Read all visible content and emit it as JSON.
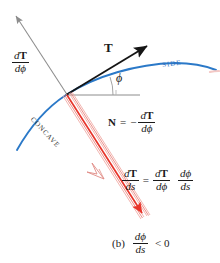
{
  "figure": {
    "caption_prefix": "(b)",
    "caption_relation": "< 0"
  },
  "colors": {
    "curve_blue": "#2b79c8",
    "vector_red": "#e8342a",
    "band_pink": "#f0a6a0",
    "axis_gray": "#8c8c8c",
    "tangent_black": "#151515",
    "text_black": "#1a1a1a"
  },
  "labels": {
    "dT_dphi": {
      "name": "dT/dphi",
      "num_d": "d",
      "num_T": "T",
      "den_d": "d",
      "den_phi": "ϕ"
    },
    "tangent_vector": "T",
    "angle_phi": "ϕ",
    "side": "SIDE",
    "concave": "CONCAVE"
  },
  "normal_equation": {
    "N": "N",
    "equals": "=",
    "minus": "−",
    "num_d": "d",
    "num_T": "T",
    "den_d": "d",
    "den_phi": "ϕ"
  },
  "chain_equation": {
    "lhs": {
      "num_d": "d",
      "num_T": "T",
      "den_d": "d",
      "den_s": "s"
    },
    "equals": "=",
    "rhs1": {
      "num_d": "d",
      "num_T": "T",
      "den_d": "d",
      "den_phi": "ϕ"
    },
    "rhs2": {
      "num_d": "d",
      "num_phi": "ϕ",
      "den_d": "d",
      "den_s": "s"
    }
  },
  "caption_fraction": {
    "num_d": "d",
    "num_phi": "ϕ",
    "den_d": "d",
    "den_s": "s"
  },
  "geometry": {
    "origin": {
      "x": 66,
      "y": 95
    },
    "tangent_tip": {
      "x": 149,
      "y": 45
    },
    "gray_arrow_tip": {
      "x": 14,
      "y": 14
    },
    "horizontal_line_end": {
      "x": 140,
      "y": 95
    },
    "red_solid_tip": {
      "x": 144,
      "y": 216
    },
    "red_hollow_tip": {
      "x": 104,
      "y": 178
    },
    "curve_left_end": {
      "x": 17,
      "y": 150
    },
    "curve_right_end": {
      "x": 216,
      "y": 70
    }
  }
}
